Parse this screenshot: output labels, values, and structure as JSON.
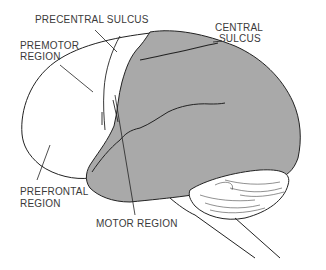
{
  "diagram": {
    "colors": {
      "background": "#ffffff",
      "shaded_region": "#a9a9a9",
      "outline": "#222222",
      "label_text": "#3a3a3a"
    },
    "labels": {
      "precentral_sulcus": "PRECENTRAL  SULCUS",
      "central_sulcus_line1": "CENTRAL",
      "central_sulcus_line2": "SULCUS",
      "premotor_line1": "PREMOTOR",
      "premotor_line2": "REGION",
      "prefrontal_line1": "PREFRONTAL",
      "prefrontal_line2": "REGION",
      "motor_region": "MOTOR REGION"
    }
  }
}
